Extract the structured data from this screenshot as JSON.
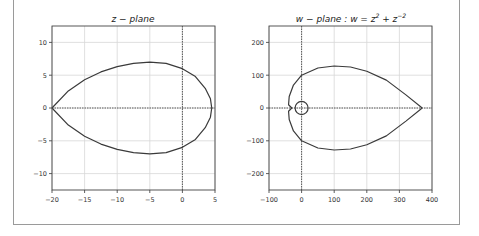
{
  "chart_data": [
    {
      "type": "line",
      "title": "z − plane",
      "xlabel": "",
      "ylabel": "",
      "xlim": [
        -20,
        5
      ],
      "ylim": [
        -12.5,
        12.5
      ],
      "xticks": [
        -20,
        -15,
        -10,
        -5,
        0,
        5
      ],
      "xtick_labels": [
        "−20",
        "−15",
        "−10",
        "−5",
        "0",
        "5"
      ],
      "yticks": [
        -10,
        -5,
        0,
        5,
        10
      ],
      "ytick_labels": [
        "−10",
        "−5",
        "0",
        "5",
        "10"
      ],
      "grid": true,
      "reference_lines": {
        "x0": true,
        "y0": true
      },
      "series": [
        {
          "name": "z contour",
          "description": "closed teardrop curve, cusp at (-20, 0), max |y| ≈ 7 near x = -5, rightmost point ≈ 4.5",
          "points": [
            [
              -20,
              0
            ],
            [
              -17.5,
              2.6
            ],
            [
              -15,
              4.3
            ],
            [
              -12.5,
              5.5
            ],
            [
              -10,
              6.3
            ],
            [
              -7.5,
              6.8
            ],
            [
              -5,
              7
            ],
            [
              -2.5,
              6.8
            ],
            [
              0,
              6
            ],
            [
              2,
              4.8
            ],
            [
              3.5,
              3
            ],
            [
              4.3,
              1.4
            ],
            [
              4.5,
              0
            ],
            [
              4.3,
              -1.4
            ],
            [
              3.5,
              -3
            ],
            [
              2,
              -4.8
            ],
            [
              0,
              -6
            ],
            [
              -2.5,
              -6.8
            ],
            [
              -5,
              -7
            ],
            [
              -7.5,
              -6.8
            ],
            [
              -10,
              -6.3
            ],
            [
              -12.5,
              -5.5
            ],
            [
              -15,
              -4.3
            ],
            [
              -17.5,
              -2.6
            ],
            [
              -20,
              0
            ]
          ]
        }
      ]
    },
    {
      "type": "line",
      "title_prefix": "w − plane : w = z",
      "title_sup1": "2",
      "title_mid": " + z",
      "title_sup2": "−2",
      "xlabel": "",
      "ylabel": "",
      "xlim": [
        -100,
        400
      ],
      "ylim": [
        -250,
        250
      ],
      "xticks": [
        -100,
        0,
        100,
        200,
        300,
        400
      ],
      "xtick_labels": [
        "−100",
        "0",
        "100",
        "200",
        "300",
        "400"
      ],
      "yticks": [
        -200,
        -100,
        0,
        100,
        200
      ],
      "ytick_labels": [
        "−200",
        "−100",
        "0",
        "100",
        "200"
      ],
      "grid": true,
      "reference_lines": {
        "x0": true,
        "y0": true
      },
      "series": [
        {
          "name": "w = z^2 + z^-2 image",
          "description": "closed heart-like curve with cusp at ≈ (370, 0), max |y| ≈ 128 near x = 100, small loop around origin of radius ≈ 20",
          "points": [
            [
              370,
              0
            ],
            [
              320,
              40
            ],
            [
              260,
              85
            ],
            [
              200,
              112
            ],
            [
              150,
              125
            ],
            [
              100,
              128
            ],
            [
              50,
              122
            ],
            [
              0,
              100
            ],
            [
              -25,
              70
            ],
            [
              -38,
              35
            ],
            [
              -40,
              10
            ],
            [
              -30,
              0
            ],
            [
              -40,
              -10
            ],
            [
              -38,
              -35
            ],
            [
              -25,
              -70
            ],
            [
              0,
              -100
            ],
            [
              50,
              -122
            ],
            [
              100,
              -128
            ],
            [
              150,
              -125
            ],
            [
              200,
              -112
            ],
            [
              260,
              -85
            ],
            [
              320,
              -40
            ],
            [
              370,
              0
            ]
          ],
          "loop": {
            "center": [
              0,
              0
            ],
            "radius": 20
          }
        }
      ]
    }
  ]
}
